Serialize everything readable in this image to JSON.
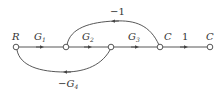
{
  "diagram": {
    "type": "signal-flow-graph",
    "colors": {
      "line": "#444444",
      "text": "#333333",
      "background": "#ffffff"
    },
    "nodes": [
      {
        "id": "R",
        "label": "R",
        "x": 16,
        "y": 47
      },
      {
        "id": "n1",
        "label": "",
        "x": 66,
        "y": 47
      },
      {
        "id": "n2",
        "label": "",
        "x": 111,
        "y": 47
      },
      {
        "id": "C1",
        "label": "C",
        "x": 160,
        "y": 47
      },
      {
        "id": "C2",
        "label": "C",
        "x": 210,
        "y": 47
      }
    ],
    "branches": [
      {
        "from": "R",
        "to": "n1",
        "gain": "G",
        "sub": "1"
      },
      {
        "from": "n1",
        "to": "n2",
        "gain": "G",
        "sub": "2"
      },
      {
        "from": "n2",
        "to": "C1",
        "gain": "G",
        "sub": "3"
      },
      {
        "from": "C1",
        "to": "C2",
        "gain": "1",
        "sub": ""
      },
      {
        "from": "C1",
        "to": "n1",
        "gain": "−1",
        "sub": ""
      },
      {
        "from": "n2",
        "to": "R",
        "gain": "−G",
        "sub": "4"
      }
    ]
  }
}
